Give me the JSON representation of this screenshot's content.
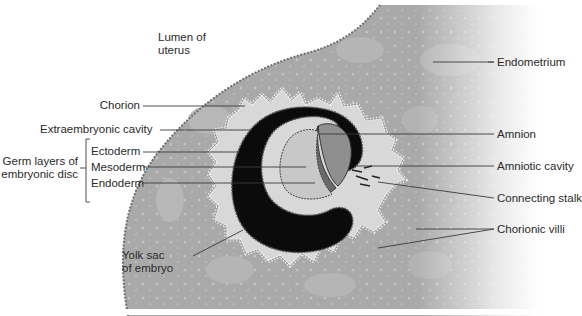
{
  "figure": {
    "colors": {
      "background": "#ffffff",
      "endometrium": "#a9a9a9",
      "endometrium_light": "#bdbdbd",
      "uterine_surface": "#7a7a7a",
      "chorion_fill": "#d8d8d8",
      "villi_dots": "#f2f2f2",
      "yolk_sac": "#0b0b0b",
      "amniotic_cavity": "#8f8f8f",
      "embryonic_disc": "#c8c8c8",
      "leader_line": "#3a3a3a",
      "label_text": "#2a2a2a"
    }
  },
  "labels": {
    "lumen": {
      "line1": "Lumen of",
      "line2": "uterus"
    },
    "endometrium": "Endometrium",
    "chorion": "Chorion",
    "extraembryonic_cavity": "Extraembryonic cavity",
    "amnion": "Amnion",
    "germ_layers": {
      "line1": "Germ layers of",
      "line2": "embryonic disc"
    },
    "ectoderm": "Ectoderm",
    "mesoderm": "Mesoderm",
    "endoderm": "Endoderm",
    "amniotic_cavity": "Amniotic cavity",
    "connecting_stalk": "Connecting stalk",
    "chorionic_villi": "Chorionic villi",
    "yolk_sac": {
      "line1": "Yolk sac",
      "line2": "of embryo"
    }
  }
}
